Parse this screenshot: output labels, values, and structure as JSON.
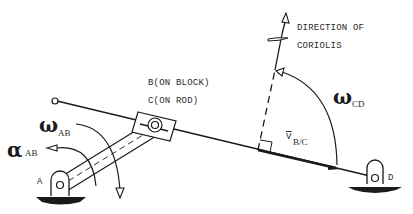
{
  "diagram": {
    "labels": {
      "direction_line1": "DIRECTION OF",
      "direction_line2": "CORIOLIS",
      "b_on_block": "B(ON BLOCK)",
      "c_on_rod": "C(ON ROD)",
      "omega_ab_symbol": "ω",
      "omega_ab_sub": "AB",
      "alpha_ab_symbol": "α",
      "alpha_ab_sub": "AB",
      "omega_cd_symbol": "ω",
      "omega_cd_sub": "CD",
      "v_bc": "V",
      "v_bc_sub": "B/C",
      "point_a": "A",
      "point_d": "D"
    },
    "colors": {
      "ink": "#1a1a1a",
      "background": "#ffffff"
    }
  }
}
